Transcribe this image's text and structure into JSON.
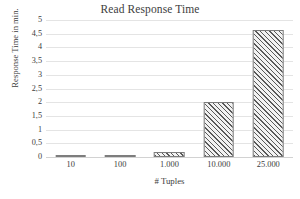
{
  "chart_data": {
    "type": "bar",
    "title": "Read Response Time",
    "xlabel": "# Tuples",
    "ylabel": "Response Time in min.",
    "categories": [
      "10",
      "100",
      "1.000",
      "10.000",
      "25.000"
    ],
    "values": [
      0.005,
      0.03,
      0.2,
      2.0,
      4.65
    ],
    "ylim": [
      0,
      5
    ],
    "ytick_labels": [
      "0",
      "0,5",
      "1",
      "1,5",
      "2",
      "2,5",
      "3",
      "3,5",
      "4",
      "4,5",
      "5"
    ],
    "ytick_values": [
      0,
      0.5,
      1,
      1.5,
      2,
      2.5,
      3,
      3.5,
      4,
      4.5,
      5
    ],
    "grid": true,
    "legend": false,
    "bar_fill": "#f2f2f2",
    "bar_hatch_color": "#595959",
    "bar_border_color": "#7d7d7d",
    "gridline_color": "#e4e4e4",
    "text_color": "#3d3d3d",
    "background": "#ffffff"
  }
}
